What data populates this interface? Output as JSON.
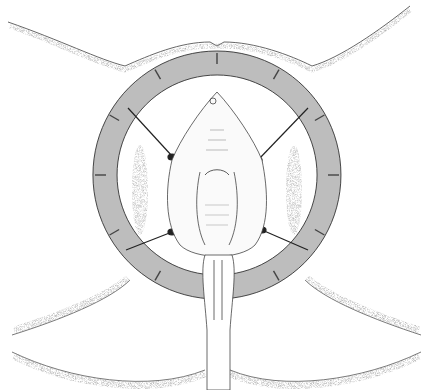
{
  "figure": {
    "type": "medical line illustration",
    "caption": ""
  },
  "retractor": {
    "center": [
      217,
      175
    ],
    "outer_radius": 124,
    "inner_radius": 100,
    "segments": 12,
    "fill": "#bdbdbd",
    "stroke": "#333333"
  },
  "stays": {
    "count": 4,
    "color": "#222222"
  },
  "colors": {
    "background": "#ffffff",
    "line": "#333333",
    "stipple": "#9a9a9a"
  }
}
